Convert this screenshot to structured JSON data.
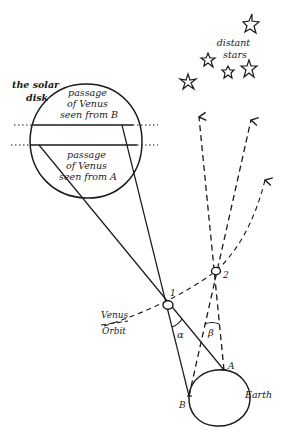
{
  "diagram": {
    "labels": {
      "solar_disk": [
        "the solar",
        "disk"
      ],
      "passage_b": [
        "passage",
        "of Venus",
        "seen from B"
      ],
      "passage_a": [
        "passage",
        "of Venus",
        "seen from A"
      ],
      "distant_stars": [
        "distant",
        "stars"
      ],
      "venus_orbit": [
        "Venus",
        "Orbit"
      ],
      "venus_pos_1": "1",
      "venus_pos_2": "2",
      "angle_alpha": "α",
      "angle_beta": "β",
      "point_a": "A",
      "point_b": "B",
      "earth": "Earth"
    },
    "colors": {
      "ink": "#1a1a1a",
      "background": "#ffffff"
    }
  }
}
